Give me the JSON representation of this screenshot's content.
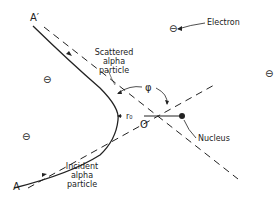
{
  "diagram": {
    "labels": {
      "a_prime": "A′",
      "a": "A",
      "scattered_line1": "Scattered",
      "scattered_line2": "alpha",
      "scattered_line3": "particle",
      "incident_line1": "Incident",
      "incident_line2": "alpha",
      "incident_line3": "particle",
      "electron": "Electron",
      "nucleus": "Nucleus",
      "phi": "φ",
      "r0": "r₀",
      "origin": "O"
    },
    "electron_symbol": "⊖",
    "electrons": [
      {
        "x": 48,
        "y": 80
      },
      {
        "x": 174,
        "y": 29
      },
      {
        "x": 270,
        "y": 74
      },
      {
        "x": 27,
        "y": 137
      }
    ],
    "colors": {
      "ink": "#222222",
      "background": "#ffffff"
    }
  }
}
